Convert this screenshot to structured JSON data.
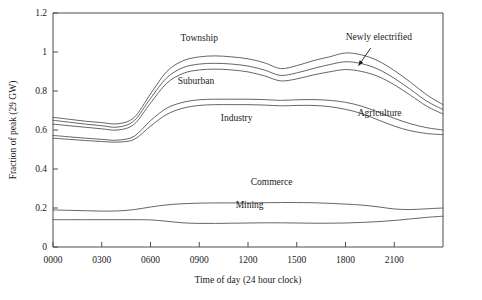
{
  "chart_data": {
    "type": "line",
    "title": "",
    "xlabel": "Time of day (24 hour clock)",
    "ylabel": "Fraction of peak (29 GW)",
    "xlim": [
      0,
      2400
    ],
    "ylim": [
      0,
      1.2
    ],
    "grid": false,
    "legend": "inline-annotations",
    "xticks": [
      "0000",
      "0300",
      "0600",
      "0900",
      "1200",
      "1500",
      "1800",
      "2100"
    ],
    "xtick_values": [
      0,
      300,
      600,
      900,
      1200,
      1500,
      1800,
      2100
    ],
    "yticks": [
      "0",
      "0.2",
      "0.4",
      "0.6",
      "0.8",
      "1",
      "1.2"
    ],
    "ytick_values": [
      0,
      0.2,
      0.4,
      0.6,
      0.8,
      1.0,
      1.2
    ],
    "x": [
      0,
      100,
      200,
      300,
      400,
      500,
      600,
      700,
      800,
      900,
      1000,
      1100,
      1200,
      1300,
      1400,
      1500,
      1600,
      1700,
      1800,
      1900,
      2000,
      2100,
      2200,
      2300,
      2400
    ],
    "series": [
      {
        "name": "Township",
        "label": "Township",
        "values": [
          0.665,
          0.655,
          0.645,
          0.638,
          0.632,
          0.665,
          0.785,
          0.9,
          0.955,
          0.975,
          0.98,
          0.975,
          0.965,
          0.945,
          0.915,
          0.93,
          0.955,
          0.975,
          0.995,
          0.985,
          0.955,
          0.905,
          0.845,
          0.78,
          0.73
        ]
      },
      {
        "name": "Newly electrified",
        "label": "Newly electrified",
        "values": [
          0.65,
          0.64,
          0.63,
          0.622,
          0.615,
          0.648,
          0.762,
          0.868,
          0.92,
          0.938,
          0.942,
          0.938,
          0.928,
          0.908,
          0.88,
          0.893,
          0.915,
          0.935,
          0.95,
          0.94,
          0.912,
          0.865,
          0.808,
          0.748,
          0.705
        ]
      },
      {
        "name": "Suburban",
        "label": "Suburban",
        "values": [
          0.63,
          0.622,
          0.614,
          0.606,
          0.6,
          0.63,
          0.738,
          0.84,
          0.89,
          0.908,
          0.912,
          0.908,
          0.898,
          0.878,
          0.852,
          0.862,
          0.882,
          0.898,
          0.91,
          0.9,
          0.875,
          0.832,
          0.778,
          0.722,
          0.682
        ]
      },
      {
        "name": "Industry",
        "label": "Industry",
        "values": [
          0.572,
          0.565,
          0.558,
          0.552,
          0.548,
          0.568,
          0.648,
          0.712,
          0.742,
          0.755,
          0.758,
          0.758,
          0.758,
          0.756,
          0.752,
          0.755,
          0.756,
          0.752,
          0.742,
          0.722,
          0.692,
          0.66,
          0.632,
          0.612,
          0.6
        ]
      },
      {
        "name": "Agriculture",
        "label": "Agriculture",
        "values": [
          0.558,
          0.552,
          0.546,
          0.541,
          0.538,
          0.552,
          0.62,
          0.68,
          0.712,
          0.726,
          0.73,
          0.73,
          0.73,
          0.728,
          0.724,
          0.726,
          0.726,
          0.72,
          0.706,
          0.684,
          0.652,
          0.62,
          0.596,
          0.582,
          0.576
        ]
      },
      {
        "name": "Commerce",
        "label": "Commerce",
        "values": [
          0.19,
          0.188,
          0.186,
          0.184,
          0.185,
          0.192,
          0.205,
          0.216,
          0.222,
          0.225,
          0.226,
          0.226,
          0.226,
          0.227,
          0.228,
          0.228,
          0.227,
          0.224,
          0.22,
          0.215,
          0.206,
          0.195,
          0.192,
          0.196,
          0.2
        ]
      },
      {
        "name": "Mining",
        "label": "Mining",
        "values": [
          0.14,
          0.14,
          0.14,
          0.14,
          0.14,
          0.14,
          0.139,
          0.132,
          0.124,
          0.121,
          0.121,
          0.122,
          0.123,
          0.124,
          0.124,
          0.123,
          0.122,
          0.122,
          0.123,
          0.126,
          0.13,
          0.136,
          0.144,
          0.152,
          0.158
        ]
      }
    ],
    "annotations": [
      {
        "text": "Township",
        "x": 900,
        "y": 1.055,
        "anchor": "middle"
      },
      {
        "text": "Suburban",
        "x": 880,
        "y": 0.838,
        "anchor": "middle"
      },
      {
        "text": "Industry",
        "x": 1130,
        "y": 0.648,
        "anchor": "middle"
      },
      {
        "text": "Newly electrified",
        "x": 2005,
        "y": 1.06,
        "anchor": "middle"
      },
      {
        "text": "Agriculture",
        "x": 2010,
        "y": 0.672,
        "anchor": "middle"
      },
      {
        "text": "Commerce",
        "x": 1345,
        "y": 0.32,
        "anchor": "middle"
      },
      {
        "text": "Mining",
        "x": 1210,
        "y": 0.2,
        "anchor": "middle"
      }
    ],
    "leader_line": {
      "from_x": 1955,
      "from_y": 1.02,
      "to_x": 1880,
      "to_y": 0.93
    }
  },
  "colors": {
    "line": "#555555",
    "axis": "#4d4d4d",
    "text": "#1a1a1a",
    "background": "#ffffff"
  }
}
